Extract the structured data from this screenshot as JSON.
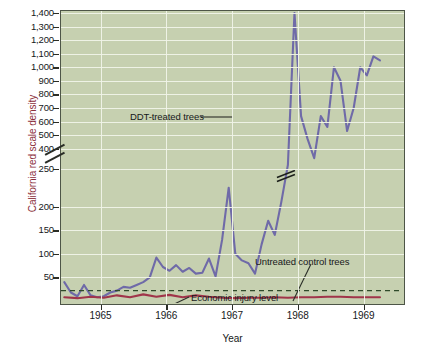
{
  "chart_data": {
    "type": "line",
    "title": "",
    "xlabel": "Year",
    "ylabel": "California red scale density",
    "grid": true,
    "legend_position": "inline-annotations",
    "y_axis": {
      "broken": true,
      "break_between": [
        250,
        400
      ],
      "tick_labels": [
        "1,400",
        "1,300",
        "1,200",
        "1,100",
        "1,000",
        "900",
        "800",
        "700",
        "600",
        "500",
        "400",
        "250",
        "200",
        "150",
        "100",
        "50"
      ],
      "tick_values": [
        1400,
        1300,
        1200,
        1100,
        1000,
        900,
        800,
        700,
        600,
        500,
        400,
        250,
        200,
        150,
        100,
        50
      ],
      "upper_segment_range": [
        250,
        1400
      ],
      "lower_segment_range": [
        0,
        250
      ]
    },
    "x_axis": {
      "tick_labels": [
        "1965",
        "1966",
        "1967",
        "1968",
        "1969"
      ],
      "tick_values": [
        1965,
        1966,
        1967,
        1968,
        1969
      ],
      "range": [
        1964.4,
        1969.6
      ]
    },
    "series": [
      {
        "name": "DDT-treated trees",
        "color": "#6f6aa8",
        "style": "solid",
        "x": [
          1964.45,
          1964.55,
          1964.65,
          1964.75,
          1964.85,
          1964.95,
          1965.05,
          1965.15,
          1965.25,
          1965.35,
          1965.45,
          1965.55,
          1965.65,
          1965.75,
          1965.85,
          1965.95,
          1966.05,
          1966.15,
          1966.25,
          1966.35,
          1966.45,
          1966.55,
          1966.65,
          1966.75,
          1966.85,
          1966.95,
          1967.05,
          1967.15,
          1967.25,
          1967.35,
          1967.45,
          1967.55,
          1967.65,
          1967.75,
          1967.85,
          1967.95,
          1968.05,
          1968.15,
          1968.25,
          1968.35,
          1968.45,
          1968.55,
          1968.65,
          1968.75,
          1968.85,
          1968.95,
          1969.05,
          1969.15,
          1969.25
        ],
        "y": [
          40,
          18,
          10,
          34,
          12,
          8,
          10,
          18,
          22,
          30,
          28,
          34,
          40,
          50,
          92,
          72,
          64,
          76,
          62,
          70,
          58,
          60,
          90,
          52,
          130,
          240,
          100,
          86,
          80,
          58,
          120,
          170,
          140,
          210,
          280,
          1400,
          640,
          470,
          330,
          640,
          560,
          1000,
          900,
          530,
          700,
          1000,
          940,
          1080,
          1050
        ]
      },
      {
        "name": "Untreated control trees",
        "color": "#a0354a",
        "style": "solid",
        "x": [
          1964.45,
          1964.65,
          1964.85,
          1965.05,
          1965.25,
          1965.45,
          1965.65,
          1965.85,
          1966.05,
          1966.25,
          1966.45,
          1966.65,
          1966.85,
          1967.05,
          1967.25,
          1967.45,
          1967.65,
          1967.85,
          1968.05,
          1968.25,
          1968.45,
          1968.65,
          1968.85,
          1969.05,
          1969.25
        ],
        "y": [
          8,
          6,
          9,
          7,
          12,
          8,
          14,
          9,
          13,
          8,
          12,
          9,
          7,
          6,
          7,
          7,
          8,
          7,
          8,
          8,
          9,
          9,
          8,
          8,
          8
        ]
      }
    ],
    "reference_lines": [
      {
        "name": "Economic injury level",
        "value": 22,
        "color": "#2f4a2a",
        "style": "dashed"
      }
    ],
    "annotations": [
      {
        "name": "ddt-treated-trees",
        "text": "DDT-treated trees"
      },
      {
        "name": "untreated-control-trees",
        "text": "Untreated control trees"
      },
      {
        "name": "economic-injury-level",
        "text": "Economic injury level"
      }
    ],
    "line_break_marker": {
      "present": true,
      "on_series": "DDT-treated trees"
    }
  },
  "axis": {
    "ylabel": "California red scale density",
    "xlabel": "Year"
  },
  "colors": {
    "plot_background": "#c6d0b0",
    "gridline": "#f0f3e8",
    "frame": "#4d5547",
    "ddt_line": "#6f6aa8",
    "control_line": "#a0354a",
    "injury_line": "#2f4a2a",
    "ylabel_text": "#8c2f3c",
    "tick_text": "#16181a"
  },
  "yticks": [
    {
      "label": "1,400"
    },
    {
      "label": "1,300"
    },
    {
      "label": "1,200"
    },
    {
      "label": "1,100"
    },
    {
      "label": "1,000"
    },
    {
      "label": "900"
    },
    {
      "label": "800"
    },
    {
      "label": "700"
    },
    {
      "label": "600"
    },
    {
      "label": "500"
    },
    {
      "label": "400"
    },
    {
      "label": "250"
    },
    {
      "label": "200"
    },
    {
      "label": "150"
    },
    {
      "label": "100"
    },
    {
      "label": "50"
    }
  ],
  "xticks": [
    {
      "label": "1965"
    },
    {
      "label": "1966"
    },
    {
      "label": "1967"
    },
    {
      "label": "1968"
    },
    {
      "label": "1969"
    }
  ],
  "annotations": {
    "ddt": "DDT-treated trees",
    "untreated": "Untreated control trees",
    "eil": "Economic injury level"
  }
}
